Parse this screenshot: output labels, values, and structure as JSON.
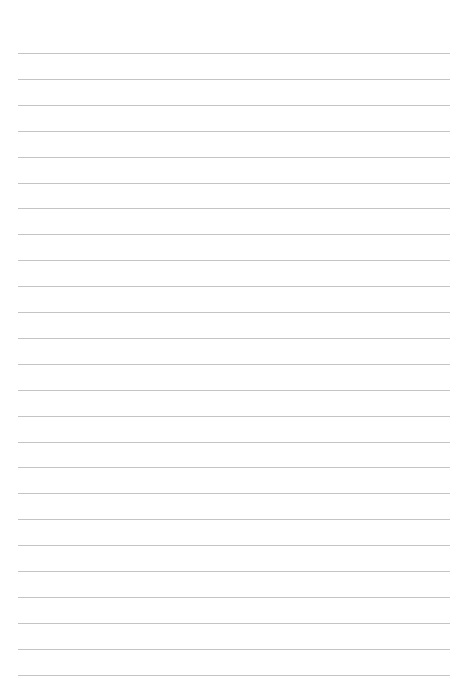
{
  "page": {
    "type": "lined-paper",
    "line_count": 25,
    "first_line_y": 53,
    "line_spacing": 25.9,
    "line_color": "#c4c4c4",
    "background": "#ffffff"
  }
}
